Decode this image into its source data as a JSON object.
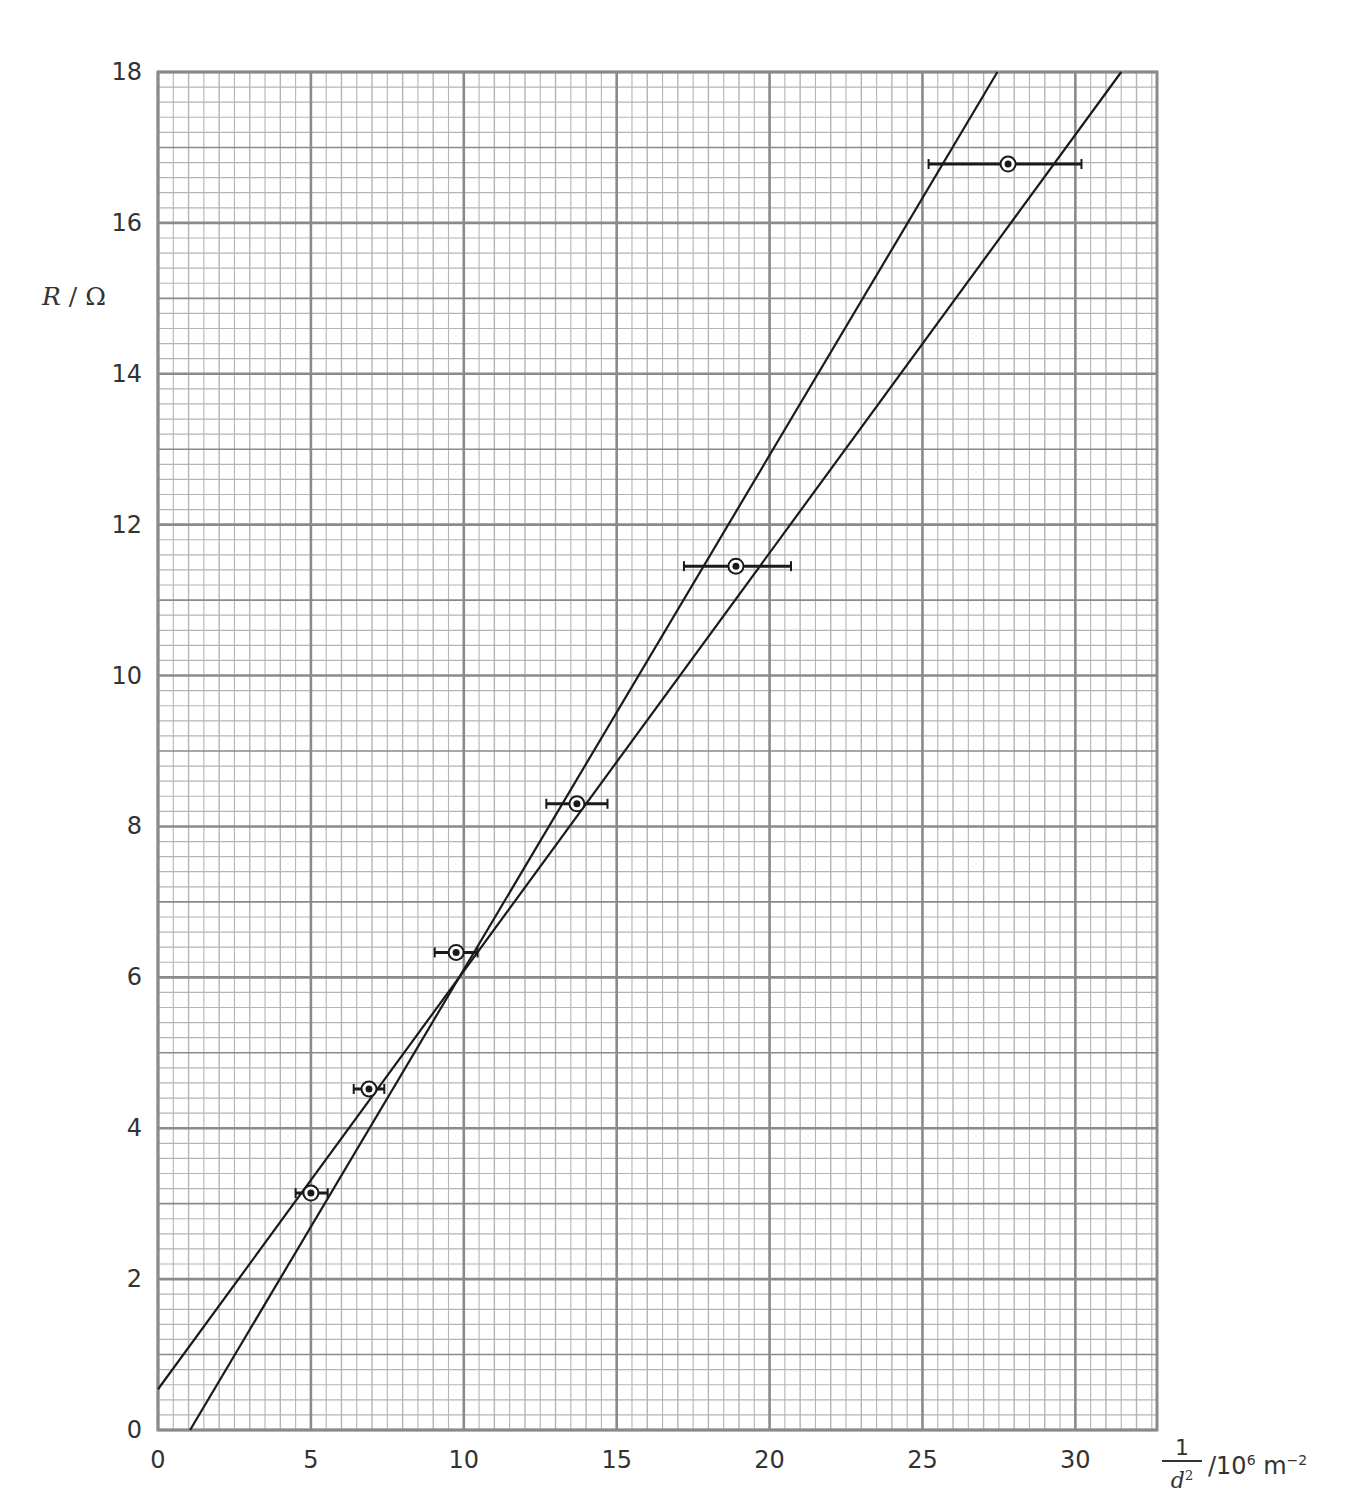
{
  "chart_data": {
    "type": "scatter",
    "title": "",
    "xlabel": "1/d² /10⁶ m⁻²",
    "xlabel_parts": {
      "numerator": "1",
      "denominator": "d",
      "denominator_power": "2",
      "unit_prefix": "/10",
      "unit_power": "6",
      "unit": " m",
      "unit_exp": "−2"
    },
    "ylabel": "R / Ω",
    "ylabel_parts": {
      "symbol": "R",
      "unit": " / Ω"
    },
    "xlim": [
      0,
      32.67
    ],
    "ylim": [
      0,
      18
    ],
    "x_ticks": [
      0,
      5,
      10,
      15,
      20,
      25,
      30
    ],
    "y_ticks": [
      0,
      2,
      4,
      6,
      8,
      10,
      12,
      14,
      16,
      18
    ],
    "grid": {
      "on": true,
      "major_x": 5,
      "mid_x": 1,
      "minor_x": 1,
      "major_y": 2,
      "mid_y": 1,
      "minor_y": 0.2
    },
    "legend": null,
    "points": [
      {
        "x": 5.0,
        "y": 3.14,
        "xerr_low": 4.5,
        "xerr_high": 5.55
      },
      {
        "x": 6.9,
        "y": 4.52,
        "xerr_low": 6.4,
        "xerr_high": 7.4
      },
      {
        "x": 9.75,
        "y": 6.33,
        "xerr_low": 9.05,
        "xerr_high": 10.45
      },
      {
        "x": 13.7,
        "y": 8.3,
        "xerr_low": 12.7,
        "xerr_high": 14.7
      },
      {
        "x": 18.9,
        "y": 11.45,
        "xerr_low": 17.2,
        "xerr_high": 20.7
      },
      {
        "x": 27.8,
        "y": 16.78,
        "xerr_low": 25.2,
        "xerr_high": 30.2
      }
    ],
    "lines": [
      {
        "name": "steepest line",
        "x1": 1.05,
        "y1": 0,
        "x2": 27.45,
        "y2": 18
      },
      {
        "name": "least steep line",
        "x1": 0,
        "y1": 0.54,
        "x2": 31.5,
        "y2": 18
      }
    ],
    "colors": {
      "grid_major": "#8a8a8a",
      "grid_minor": "#b4b4b4",
      "data": "#1a1a1a",
      "text": "#333333"
    }
  },
  "axes": {
    "x_tick_labels": [
      "0",
      "5",
      "10",
      "15",
      "20",
      "25",
      "30"
    ],
    "y_tick_labels": [
      "0",
      "2",
      "4",
      "6",
      "8",
      "10",
      "12",
      "14",
      "16",
      "18"
    ]
  }
}
